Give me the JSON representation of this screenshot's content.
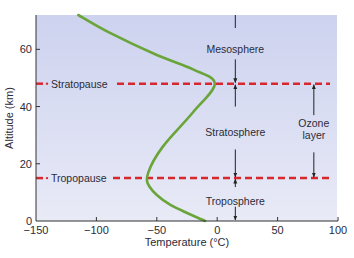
{
  "chart_data": {
    "type": "line",
    "title": "",
    "xlabel": "Temperature (°C)",
    "ylabel": "Altitude (km)",
    "xlim": [
      -150,
      100
    ],
    "ylim": [
      0,
      72
    ],
    "x_ticks": [
      -150,
      -100,
      -50,
      0,
      50,
      100
    ],
    "x_tick_labels": [
      "−150",
      "−100",
      "−50",
      "0",
      "50",
      "100"
    ],
    "y_ticks": [
      0,
      20,
      40,
      60
    ],
    "y_tick_labels": [
      "0",
      "20",
      "40",
      "60"
    ],
    "grid": false,
    "series": [
      {
        "name": "Temperature profile",
        "color": "#6aa53a",
        "points": [
          [
            -115,
            72
          ],
          [
            -90,
            66
          ],
          [
            -50,
            58
          ],
          [
            -20,
            53
          ],
          [
            -2,
            48
          ],
          [
            -20,
            38
          ],
          [
            -45,
            26
          ],
          [
            -57,
            17
          ],
          [
            -56,
            12
          ],
          [
            -40,
            6
          ],
          [
            -10,
            0
          ]
        ]
      }
    ],
    "reference_lines": [
      {
        "label": "Stratopause",
        "altitude": 48,
        "color": "#d9272e"
      },
      {
        "label": "Tropopause",
        "altitude": 15,
        "color": "#d9272e"
      }
    ],
    "annotations": [
      {
        "text": "Mesosphere",
        "x": 15,
        "y": 60
      },
      {
        "text": "Stratosphere",
        "x": 15,
        "y": 31
      },
      {
        "text": "Troposphere",
        "x": 15,
        "y": 7
      },
      {
        "text": "Ozone layer",
        "x": 80,
        "y": 31,
        "spans": [
          15,
          48
        ]
      }
    ],
    "background_color": "#dcdff3"
  }
}
